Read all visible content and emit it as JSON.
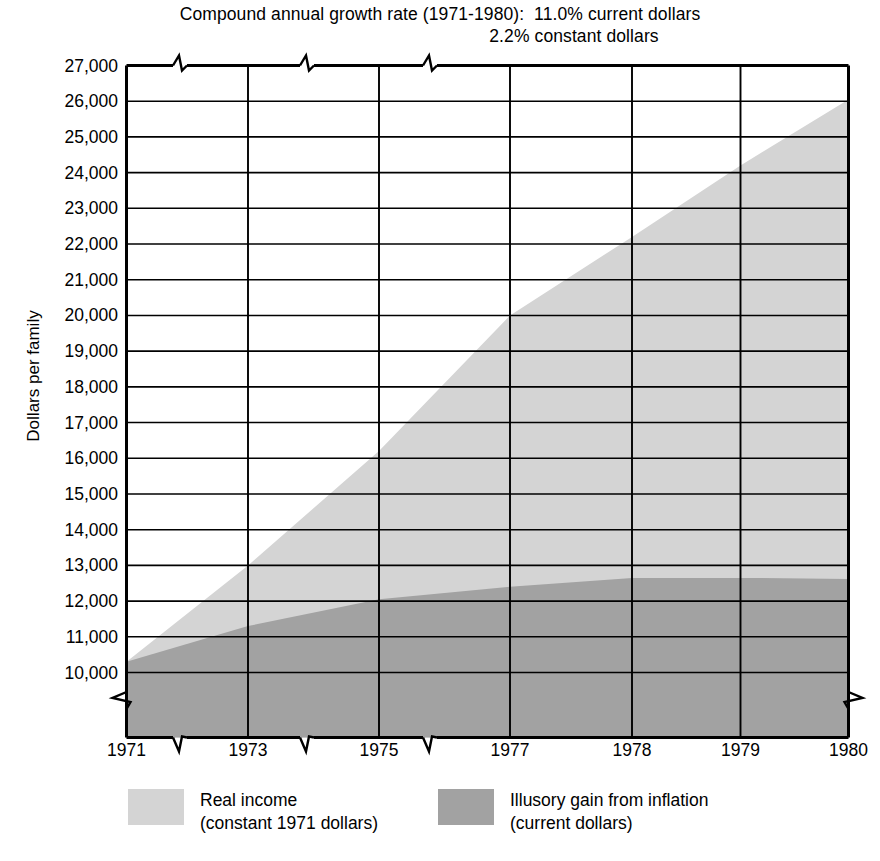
{
  "chart_data": {
    "type": "area",
    "title": "Compound annual growth rate (1971-1980):  11.0% current dollars",
    "title_line_1": "Compound annual growth rate (1971-1980):  11.0% current dollars",
    "title_line_2": "2.2% constant dollars",
    "growth_rate_current_dollars": "11.0%",
    "growth_rate_constant_dollars": "2.2%",
    "period": "1971-1980",
    "xlabel": "",
    "ylabel": "Dollars per family",
    "ylim": [
      10000,
      27000
    ],
    "ytick_labels": [
      "27,000",
      "26,000",
      "25,000",
      "24,000",
      "23,000",
      "22,000",
      "21,000",
      "20,000",
      "19,000",
      "18,000",
      "17,000",
      "16,000",
      "15,000",
      "14,000",
      "13,000",
      "12,000",
      "11,000",
      "10,000"
    ],
    "ytick_values": [
      27000,
      26000,
      25000,
      24000,
      23000,
      22000,
      21000,
      20000,
      19000,
      18000,
      17000,
      16000,
      15000,
      14000,
      13000,
      12000,
      11000,
      10000
    ],
    "y_axis_break_below": 10000,
    "grid": true,
    "x": [
      "1971",
      "1973",
      "1975",
      "1977",
      "1978",
      "1979",
      "1980"
    ],
    "x_axis_break_marks": [
      1972,
      1974,
      1976
    ],
    "stacked": true,
    "series": [
      {
        "name": "Illusory gain from inflation",
        "sublabel": "(current dollars)",
        "color": "#a2a2a2",
        "values": [
          10300,
          11300,
          12050,
          12400,
          12650,
          12650,
          12620
        ],
        "stack_order": 0
      },
      {
        "name": "Real income",
        "sublabel": "(constant 1971 dollars)",
        "color": "#d4d4d4",
        "values": [
          10300,
          13000,
          16200,
          20000,
          22200,
          24200,
          26050
        ],
        "stack_order": 1,
        "note": "total (top boundary of stacked area)"
      }
    ],
    "legend": {
      "position": "bottom",
      "entries": [
        {
          "label": "Real income",
          "sublabel": "(constant 1971 dollars)",
          "color": "#d4d4d4"
        },
        {
          "label": "Illusory gain from inflation",
          "sublabel": "(current dollars)",
          "color": "#a2a2a2"
        }
      ]
    }
  }
}
